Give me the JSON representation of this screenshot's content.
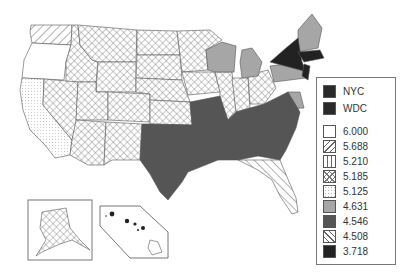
{
  "map": {
    "title": "",
    "region": "United States",
    "insets": [
      "Alaska",
      "Hawaii"
    ]
  },
  "legend": {
    "items": [
      {
        "label": "NYC",
        "fill": "#2a2a2a",
        "pattern": "solid"
      },
      {
        "label": "WDC",
        "fill": "#2a2a2a",
        "pattern": "solid"
      },
      {
        "label": "6.000",
        "fill": "#ffffff",
        "pattern": "blank"
      },
      {
        "label": "5.688",
        "fill": "#ffffff",
        "pattern": "diagonal-forward"
      },
      {
        "label": "5.210",
        "fill": "#ffffff",
        "pattern": "vertical-lines"
      },
      {
        "label": "5.185",
        "fill": "#ffffff",
        "pattern": "crosshatch"
      },
      {
        "label": "5.125",
        "fill": "#ffffff",
        "pattern": "dots"
      },
      {
        "label": "4.631",
        "fill": "#a6a6a6",
        "pattern": "solid"
      },
      {
        "label": "4.546",
        "fill": "#555555",
        "pattern": "solid"
      },
      {
        "label": "4.508",
        "fill": "#ffffff",
        "pattern": "diagonal-back"
      },
      {
        "label": "3.718",
        "fill": "#222222",
        "pattern": "solid"
      }
    ]
  }
}
